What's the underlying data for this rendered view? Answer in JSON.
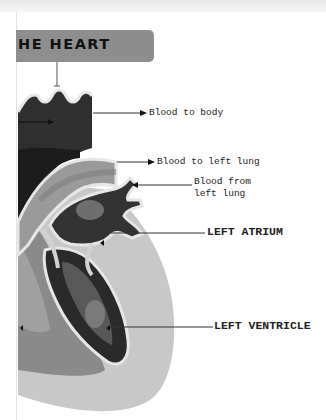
{
  "title": "HE HEART",
  "labels": {
    "blood_to_body": "Blood to body",
    "blood_to_left_lung": "Blood to left lung",
    "blood_from_left_lung_1": "Blood from",
    "blood_from_left_lung_2": "left lung",
    "left_atrium": "LEFT ATRIUM",
    "left_ventricle": "LEFT VENTRICLE"
  },
  "colors": {
    "title_bar": "#8e8e8e",
    "dark": "#2a2a2a",
    "mid_dark": "#4e4e4e",
    "mid": "#7a7a7a",
    "light": "#b4b4b4",
    "lighter": "#cfcfcf",
    "outline": "#e6e6e6"
  }
}
